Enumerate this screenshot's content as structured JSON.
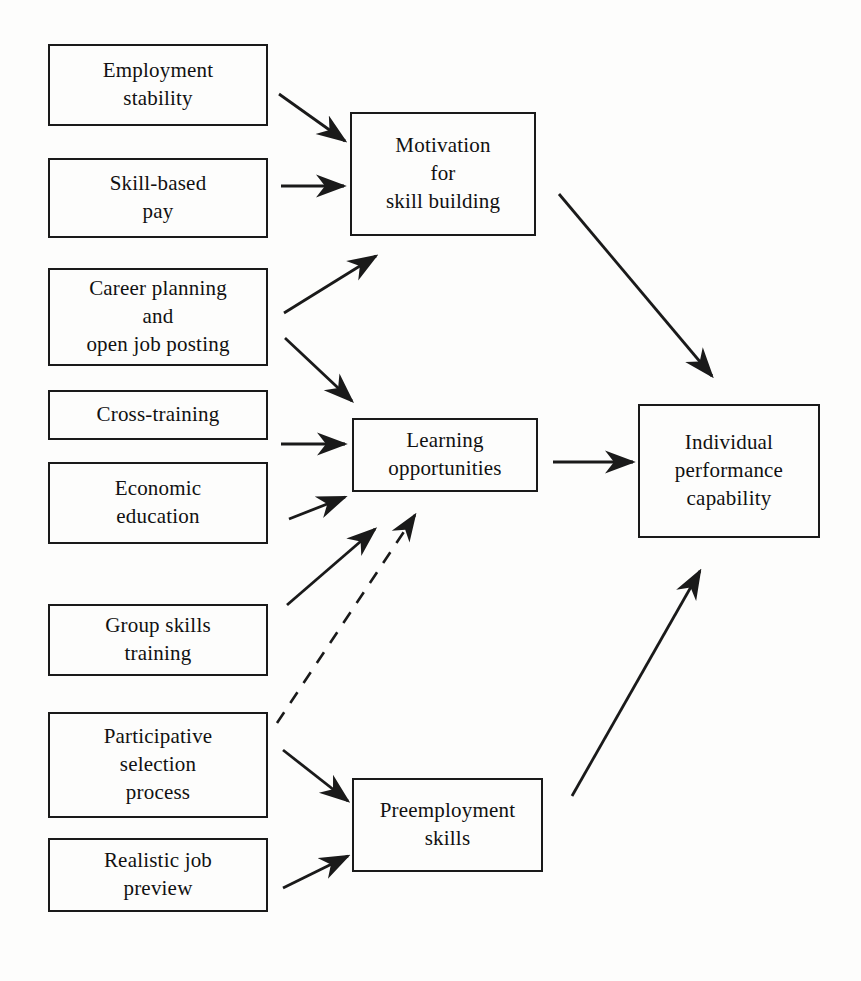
{
  "diagram": {
    "type": "flow-diagram",
    "background_color": "#fdfdfc",
    "line_color": "#1a1a1a",
    "text_color": "#111111",
    "canvas": {
      "width": 861,
      "height": 981
    }
  },
  "nodes": [
    {
      "id": "employment-stability",
      "label": "Employment\nstability",
      "column": "inputs",
      "box": {
        "x": 48,
        "y": 44,
        "w": 220,
        "h": 82
      }
    },
    {
      "id": "skill-based-pay",
      "label": "Skill-based\npay",
      "column": "inputs",
      "box": {
        "x": 48,
        "y": 158,
        "w": 220,
        "h": 80
      }
    },
    {
      "id": "career-planning-open-job-posting",
      "label": "Career planning\nand\nopen job posting",
      "column": "inputs",
      "box": {
        "x": 48,
        "y": 268,
        "w": 220,
        "h": 98
      }
    },
    {
      "id": "cross-training",
      "label": "Cross-training",
      "column": "inputs",
      "box": {
        "x": 48,
        "y": 390,
        "w": 220,
        "h": 50
      }
    },
    {
      "id": "economic-education",
      "label": "Economic\neducation",
      "column": "inputs",
      "box": {
        "x": 48,
        "y": 462,
        "w": 220,
        "h": 82
      }
    },
    {
      "id": "group-skills-training",
      "label": "Group skills\ntraining",
      "column": "inputs",
      "box": {
        "x": 48,
        "y": 604,
        "w": 220,
        "h": 72
      }
    },
    {
      "id": "participative-selection-process",
      "label": "Participative\nselection\nprocess",
      "column": "inputs",
      "box": {
        "x": 48,
        "y": 712,
        "w": 220,
        "h": 106
      }
    },
    {
      "id": "realistic-job-preview",
      "label": "Realistic job\npreview",
      "column": "inputs",
      "box": {
        "x": 48,
        "y": 838,
        "w": 220,
        "h": 74
      }
    },
    {
      "id": "motivation-for-skill-building",
      "label": "Motivation\nfor\nskill building",
      "column": "mediators",
      "box": {
        "x": 350,
        "y": 112,
        "w": 186,
        "h": 124
      }
    },
    {
      "id": "learning-opportunities",
      "label": "Learning\nopportunities",
      "column": "mediators",
      "box": {
        "x": 352,
        "y": 418,
        "w": 186,
        "h": 74
      }
    },
    {
      "id": "preemployment-skills",
      "label": "Preemployment\nskills",
      "column": "mediators",
      "box": {
        "x": 352,
        "y": 778,
        "w": 191,
        "h": 94
      }
    },
    {
      "id": "individual-performance-capability",
      "label": "Individual\nperformance\ncapability",
      "column": "outcome",
      "box": {
        "x": 638,
        "y": 404,
        "w": 182,
        "h": 134
      }
    }
  ],
  "edges": [
    {
      "id": "employment-stability-to-motivation",
      "from": "employment-stability",
      "to": "motivation-for-skill-building",
      "style": "solid",
      "path": {
        "x1": 279,
        "y1": 94,
        "x2": 345,
        "y2": 141
      }
    },
    {
      "id": "skill-based-pay-to-motivation",
      "from": "skill-based-pay",
      "to": "motivation-for-skill-building",
      "style": "solid",
      "path": {
        "x1": 281,
        "y1": 186,
        "x2": 344,
        "y2": 186
      }
    },
    {
      "id": "career-planning-to-motivation",
      "from": "career-planning-open-job-posting",
      "to": "motivation-for-skill-building",
      "style": "solid",
      "path": {
        "x1": 284,
        "y1": 313,
        "x2": 376,
        "y2": 256
      }
    },
    {
      "id": "career-planning-to-learning",
      "from": "career-planning-open-job-posting",
      "to": "learning-opportunities",
      "style": "solid",
      "path": {
        "x1": 285,
        "y1": 338,
        "x2": 352,
        "y2": 401
      }
    },
    {
      "id": "cross-training-to-learning",
      "from": "cross-training",
      "to": "learning-opportunities",
      "style": "solid",
      "path": {
        "x1": 281,
        "y1": 444,
        "x2": 345,
        "y2": 444
      }
    },
    {
      "id": "economic-education-to-learning",
      "from": "economic-education",
      "to": "learning-opportunities",
      "style": "solid",
      "path": {
        "x1": 289,
        "y1": 519,
        "x2": 345,
        "y2": 497
      }
    },
    {
      "id": "group-skills-training-to-learning",
      "from": "group-skills-training",
      "to": "learning-opportunities",
      "style": "solid",
      "path": {
        "x1": 287,
        "y1": 605,
        "x2": 375,
        "y2": 529
      }
    },
    {
      "id": "participative-selection-to-learning",
      "from": "participative-selection-process",
      "to": "learning-opportunities",
      "style": "dashed",
      "path": {
        "x1": 277,
        "y1": 723,
        "x2": 415,
        "y2": 515
      }
    },
    {
      "id": "participative-selection-to-preemployment",
      "from": "participative-selection-process",
      "to": "preemployment-skills",
      "style": "solid",
      "path": {
        "x1": 283,
        "y1": 750,
        "x2": 348,
        "y2": 801
      }
    },
    {
      "id": "realistic-job-preview-to-preemployment",
      "from": "realistic-job-preview",
      "to": "preemployment-skills",
      "style": "solid",
      "path": {
        "x1": 283,
        "y1": 888,
        "x2": 348,
        "y2": 856
      }
    },
    {
      "id": "motivation-to-individual-performance",
      "from": "motivation-for-skill-building",
      "to": "individual-performance-capability",
      "style": "solid",
      "path": {
        "x1": 559,
        "y1": 194,
        "x2": 712,
        "y2": 376
      }
    },
    {
      "id": "learning-to-individual-performance",
      "from": "learning-opportunities",
      "to": "individual-performance-capability",
      "style": "solid",
      "path": {
        "x1": 553,
        "y1": 462,
        "x2": 633,
        "y2": 462
      }
    },
    {
      "id": "preemployment-to-individual-performance",
      "from": "preemployment-skills",
      "to": "individual-performance-capability",
      "style": "solid",
      "path": {
        "x1": 572,
        "y1": 796,
        "x2": 700,
        "y2": 571
      }
    }
  ]
}
